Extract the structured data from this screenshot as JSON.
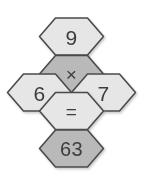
{
  "puzzle": {
    "title": "Hexagon equation puzzle",
    "equation": "9 x 7 = 63",
    "colors": {
      "light_fill": "#e6e6e6",
      "dark_fill": "#b9b9b9",
      "outline": "#4a4a4a",
      "text": "#3d3d3d",
      "background": "#ffffff"
    },
    "cells": [
      {
        "id": "top",
        "label": "9",
        "role": "operand",
        "shade": "light",
        "cx": 71.5,
        "cy": 36.5
      },
      {
        "id": "center-operator",
        "label": "×",
        "role": "operator",
        "shade": "dark",
        "cx": 71.5,
        "cy": 74.0
      },
      {
        "id": "left",
        "label": "6",
        "role": "operand",
        "shade": "light",
        "cx": 39.5,
        "cy": 92.5
      },
      {
        "id": "right",
        "label": "7",
        "role": "operand",
        "shade": "light",
        "cx": 103.5,
        "cy": 92.5
      },
      {
        "id": "center-equals",
        "label": "=",
        "role": "operator",
        "shade": "light",
        "cx": 71.5,
        "cy": 111.0
      },
      {
        "id": "bottom",
        "label": "63",
        "role": "result",
        "shade": "dark",
        "cx": 71.5,
        "cy": 148.5
      }
    ]
  }
}
